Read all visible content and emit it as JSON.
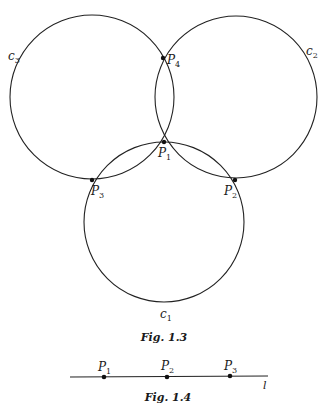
{
  "figure_1_3": {
    "caption": "Fig. 1.3",
    "circles": [
      {
        "id": "c1",
        "label": "c",
        "sub": "1",
        "cx": 164,
        "cy": 222,
        "r": 80
      },
      {
        "id": "c2",
        "label": "c",
        "sub": "2",
        "cx": 236,
        "cy": 97,
        "r": 81
      },
      {
        "id": "c3",
        "label": "c",
        "sub": "3",
        "cx": 92,
        "cy": 97,
        "r": 82
      }
    ],
    "points": [
      {
        "id": "P1",
        "label": "P",
        "sub": "1",
        "x": 164,
        "y": 163
      },
      {
        "id": "P2",
        "label": "P",
        "sub": "2",
        "x": 235,
        "y": 180
      },
      {
        "id": "P3",
        "label": "P",
        "sub": "3",
        "x": 92,
        "y": 180
      },
      {
        "id": "P4",
        "label": "P",
        "sub": "4",
        "x": 163,
        "y": 58
      }
    ]
  },
  "figure_1_4": {
    "caption": "Fig. 1.4",
    "line_label": "l",
    "points": [
      {
        "id": "P1",
        "label": "P",
        "sub": "1",
        "x": 104
      },
      {
        "id": "P2",
        "label": "P",
        "sub": "2",
        "x": 167
      },
      {
        "id": "P3",
        "label": "P",
        "sub": "3",
        "x": 230
      }
    ]
  }
}
